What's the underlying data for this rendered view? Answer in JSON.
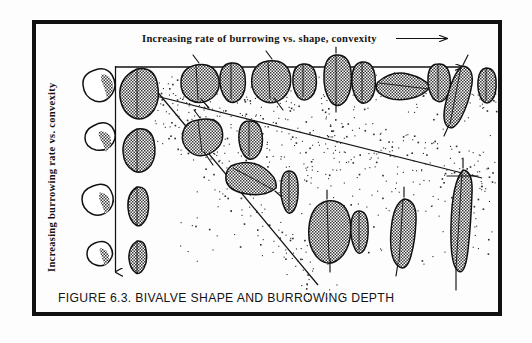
{
  "figure": {
    "id": "6.3",
    "caption": "FIGURE 6.3.  BIVALVE SHAPE AND BURROWING DEPTH",
    "x_axis_label": "Increasing rate of burrowing vs. shape, convexity",
    "x_axis_arrow": "⟶",
    "y_axis_label": "Increasing burrowing rate vs. convexity",
    "frame_color": "#111111",
    "ink_color": "#141414",
    "background_color": "#fdfdfd"
  },
  "chart_data": {
    "type": "scatter",
    "title": "FIGURE 6.3.  BIVALVE SHAPE AND BURROWING DEPTH",
    "xlabel": "Increasing rate of burrowing vs. shape, convexity",
    "ylabel": "Increasing burrowing rate vs. convexity",
    "grid": false,
    "legend": "none",
    "xlim": [
      0,
      100
    ],
    "ylim": [
      0,
      100
    ],
    "reference_column": {
      "label": "reference shell series",
      "lateral_views": [
        {
          "index": 1,
          "form": "circular-convex",
          "x": 9,
          "y": 14
        },
        {
          "index": 2,
          "form": "sub-circular",
          "x": 9,
          "y": 40
        },
        {
          "index": 3,
          "form": "circular",
          "x": 9,
          "y": 64
        },
        {
          "index": 4,
          "form": "small-rounded",
          "x": 9,
          "y": 85
        }
      ],
      "dorsal_views": [
        {
          "index": 1,
          "form": "broad-inflated",
          "x": 22,
          "y": 14
        },
        {
          "index": 2,
          "form": "ovate",
          "x": 22,
          "y": 40
        },
        {
          "index": 3,
          "form": "narrow-elongate",
          "x": 22,
          "y": 64
        },
        {
          "index": 4,
          "form": "compressed-slender",
          "x": 22,
          "y": 85
        }
      ]
    },
    "sediment_surface_y": 18,
    "boundary_lines": [
      {
        "name": "upper-wedge-line",
        "x1": 24,
        "y1": 26,
        "x2": 100,
        "y2": 56
      },
      {
        "name": "lower-wedge-line",
        "x1": 24,
        "y1": 22,
        "x2": 58,
        "y2": 97
      }
    ],
    "series": [
      {
        "name": "shallow burrowers (at sediment surface)",
        "points": [
          {
            "x": 32,
            "y": 19,
            "form": "rounded-inflated",
            "depth": "surface"
          },
          {
            "x": 41,
            "y": 19,
            "form": "ovate",
            "depth": "surface"
          },
          {
            "x": 50,
            "y": 19,
            "form": "angular-trigonal",
            "depth": "surface"
          },
          {
            "x": 58,
            "y": 19,
            "form": "ovate-small",
            "depth": "surface"
          },
          {
            "x": 67,
            "y": 17,
            "form": "elongate-ovate",
            "depth": "surface"
          },
          {
            "x": 74,
            "y": 19,
            "form": "ovate-ribbed",
            "depth": "surface"
          },
          {
            "x": 81,
            "y": 21,
            "form": "transverse-elongate",
            "depth": "surface"
          },
          {
            "x": 88,
            "y": 19,
            "form": "narrow-ovate",
            "depth": "surface"
          },
          {
            "x": 93,
            "y": 22,
            "form": "elongate-oblique",
            "depth": "shallow"
          },
          {
            "x": 98,
            "y": 20,
            "form": "slender-ovate",
            "depth": "surface"
          }
        ]
      },
      {
        "name": "intermediate burrowers",
        "points": [
          {
            "x": 33,
            "y": 36,
            "form": "rounded-quadrate",
            "depth": "intermediate"
          },
          {
            "x": 43,
            "y": 36,
            "form": "ovate",
            "depth": "intermediate"
          },
          {
            "x": 41,
            "y": 52,
            "form": "elongate-oblique",
            "depth": "intermediate"
          },
          {
            "x": 50,
            "y": 54,
            "form": "slender-lanceolate",
            "depth": "intermediate"
          }
        ]
      },
      {
        "name": "deep burrowers",
        "points": [
          {
            "x": 59,
            "y": 72,
            "form": "large-ovate",
            "depth": "deep"
          },
          {
            "x": 66,
            "y": 76,
            "form": "small-elongate",
            "depth": "deep"
          },
          {
            "x": 76,
            "y": 74,
            "form": "elongate-truncate",
            "depth": "deep"
          },
          {
            "x": 88,
            "y": 75,
            "form": "razor-elongate",
            "depth": "very deep"
          }
        ]
      }
    ]
  }
}
